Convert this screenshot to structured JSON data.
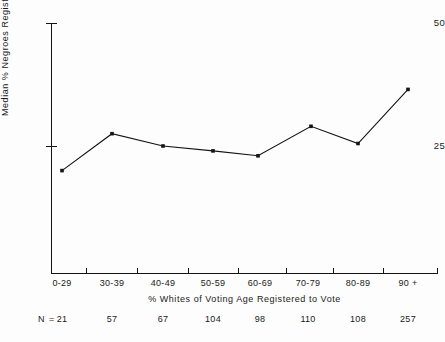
{
  "chart_data": {
    "type": "line",
    "title": "",
    "xlabel": "% Whites of Voting Age Registered to Vote",
    "ylabel": "Median % Negroes Registered",
    "categories": [
      "0-29",
      "30-39",
      "40-49",
      "50-59",
      "60-69",
      "70-79",
      "80-89",
      "90 +"
    ],
    "values": [
      20,
      27.5,
      25,
      24,
      23,
      29,
      25.5,
      36.5
    ],
    "n_label": "N =",
    "n_values": [
      21,
      57,
      67,
      104,
      98,
      110,
      108,
      257
    ],
    "ylim": [
      0,
      50
    ],
    "yticks": [
      50,
      25
    ],
    "ytick_labels": [
      "50",
      "25"
    ],
    "grid": false,
    "legend": false,
    "marker": "square",
    "line_color": "#141414",
    "marker_color": "#141414",
    "axis_color": "#141414",
    "background_color": "#fdfdfd"
  }
}
